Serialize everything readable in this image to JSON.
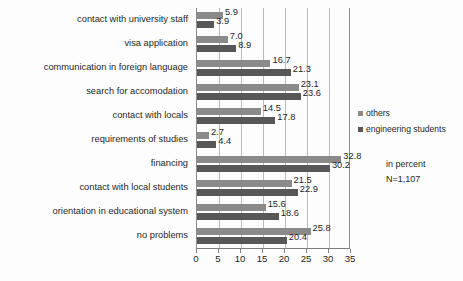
{
  "chart_data": {
    "type": "bar",
    "orientation": "horizontal",
    "title": "",
    "xlabel": "",
    "ylabel": "",
    "xlim": [
      0,
      35
    ],
    "xticks": [
      0,
      5,
      10,
      15,
      20,
      25,
      30,
      35
    ],
    "grid": true,
    "legend_position": "right",
    "unit_note": "in percent",
    "sample_note": "N=1,107",
    "categories": [
      "contact with university staff",
      "visa application",
      "communication in foreign language",
      "search for accomodation",
      "contact with locals",
      "requirements of studies",
      "financing",
      "contact with local students",
      "orientation in educational system",
      "no problems"
    ],
    "series": [
      {
        "name": "others",
        "color": "#8a8a8a",
        "values": [
          5.9,
          7.0,
          16.7,
          23.1,
          14.5,
          2.7,
          32.8,
          21.5,
          15.6,
          25.8
        ],
        "labels": [
          "5.9",
          "7.0",
          "16.7",
          "23.1",
          "14.5",
          "2.7",
          "32.8",
          "21.5",
          "15.6",
          "25.8"
        ]
      },
      {
        "name": "engineering students",
        "color": "#575757",
        "values": [
          3.9,
          8.9,
          21.3,
          23.6,
          17.8,
          4.4,
          30.2,
          22.9,
          18.6,
          20.4
        ],
        "labels": [
          "3.9",
          "8.9",
          "21.3",
          "23.6",
          "17.8",
          "4.4",
          "30.2",
          "22.9",
          "18.6",
          "20.4"
        ]
      }
    ]
  }
}
